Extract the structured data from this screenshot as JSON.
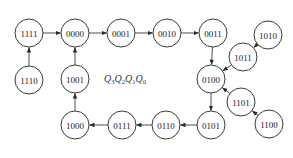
{
  "diagram": {
    "title_label": {
      "vars": [
        {
          "name": "Q",
          "sub": "3"
        },
        {
          "name": "Q",
          "sub": "2"
        },
        {
          "name": "Q",
          "sub": "1"
        },
        {
          "name": "Q",
          "sub": "0"
        }
      ]
    },
    "states": [
      {
        "id": "1111",
        "x": 29,
        "y": 33
      },
      {
        "id": "0000",
        "x": 75,
        "y": 33
      },
      {
        "id": "0001",
        "x": 121,
        "y": 33
      },
      {
        "id": "0010",
        "x": 167,
        "y": 33
      },
      {
        "id": "0011",
        "x": 213,
        "y": 33
      },
      {
        "id": "1010",
        "x": 268,
        "y": 35
      },
      {
        "id": "1011",
        "x": 243,
        "y": 57
      },
      {
        "id": "0100",
        "x": 211,
        "y": 79
      },
      {
        "id": "1101",
        "x": 241,
        "y": 102
      },
      {
        "id": "1100",
        "x": 269,
        "y": 124
      },
      {
        "id": "1110",
        "x": 29,
        "y": 80
      },
      {
        "id": "1001",
        "x": 75,
        "y": 79
      },
      {
        "id": "1000",
        "x": 75,
        "y": 125
      },
      {
        "id": "0111",
        "x": 122,
        "y": 125
      },
      {
        "id": "0110",
        "x": 166,
        "y": 125
      },
      {
        "id": "0101",
        "x": 211,
        "y": 125
      }
    ],
    "transitions": [
      {
        "from": "1111",
        "to": "0000"
      },
      {
        "from": "0000",
        "to": "0001"
      },
      {
        "from": "0001",
        "to": "0010"
      },
      {
        "from": "0010",
        "to": "0011"
      },
      {
        "from": "0011",
        "to": "0100"
      },
      {
        "from": "1010",
        "to": "1011"
      },
      {
        "from": "1011",
        "to": "0100"
      },
      {
        "from": "0100",
        "to": "0101"
      },
      {
        "from": "1101",
        "to": "0100"
      },
      {
        "from": "1100",
        "to": "1101"
      },
      {
        "from": "0101",
        "to": "0110"
      },
      {
        "from": "0110",
        "to": "0111"
      },
      {
        "from": "0111",
        "to": "1000"
      },
      {
        "from": "1000",
        "to": "1001"
      },
      {
        "from": "1001",
        "to": "0000"
      },
      {
        "from": "1110",
        "to": "1111"
      }
    ],
    "node_radius": 14,
    "colors": {
      "stroke": "#3a3a3a",
      "text": "#222222",
      "background": "#ffffff"
    }
  }
}
